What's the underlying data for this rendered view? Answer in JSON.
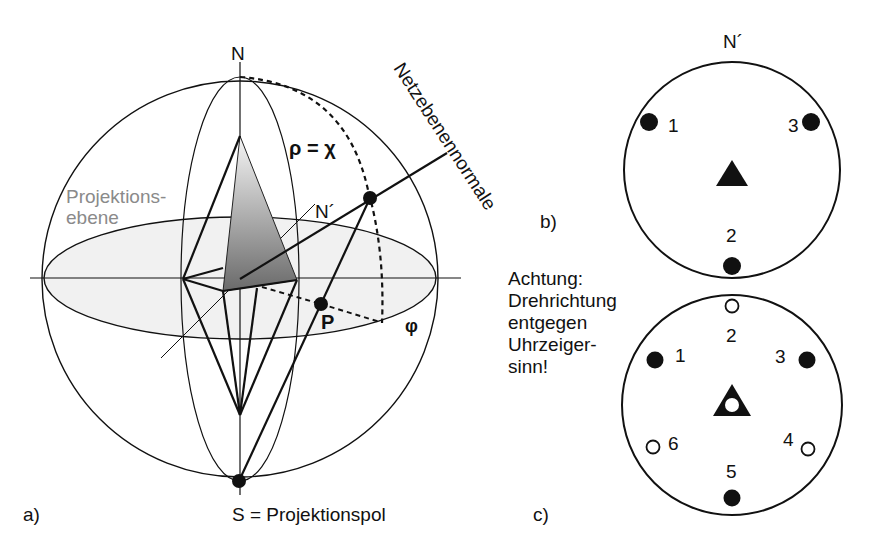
{
  "figure": {
    "panel_a": {
      "label": "a)",
      "north_label": "N",
      "projected_north_label": "N´",
      "angle_label": "ρ = χ",
      "azimuth_label": "φ",
      "point_label": "P",
      "plane_label_line1": "Projektions-",
      "plane_label_line2": "ebene",
      "normal_label": "Netzebenennormale",
      "pole_label": "S = Projektionspol"
    },
    "panel_b": {
      "label": "b)",
      "north_label": "N´",
      "points": [
        {
          "id": "1",
          "type": "filled",
          "label": "1"
        },
        {
          "id": "2",
          "type": "filled",
          "label": "2"
        },
        {
          "id": "3",
          "type": "filled",
          "label": "3"
        }
      ],
      "center_symbol": "filled-triangle"
    },
    "panel_c": {
      "label": "c)",
      "points": [
        {
          "id": "1",
          "type": "filled",
          "label": "1"
        },
        {
          "id": "2",
          "type": "open",
          "label": "2"
        },
        {
          "id": "3",
          "type": "filled",
          "label": "3"
        },
        {
          "id": "4",
          "type": "open",
          "label": "4"
        },
        {
          "id": "5",
          "type": "filled",
          "label": "5"
        },
        {
          "id": "6",
          "type": "open",
          "label": "6"
        }
      ],
      "center_symbol": "triangle-with-open-circle"
    },
    "note": {
      "lines": [
        "Achtung:",
        "Drehrichtung",
        "entgegen",
        "Uhrzeiger-",
        "sinn!"
      ]
    },
    "colors": {
      "line": "#111111",
      "plane_fill": "#f2f2f2",
      "gray_text": "#8a8a8a",
      "shade_dark": "#6e6e6e",
      "shade_light": "#f4f4f4"
    }
  }
}
